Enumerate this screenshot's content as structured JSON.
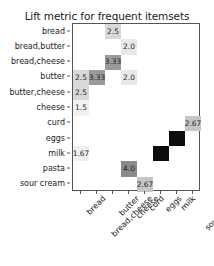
{
  "chart_data": {
    "type": "heatmap",
    "title": "Lift metric for frequent itemsets",
    "xlabel": "",
    "ylabel": "",
    "grid": false,
    "legend": "none",
    "colormap": "grays-reversed",
    "value_range": [
      1.5,
      9.0
    ],
    "columns": [
      "bread",
      "bread,cheese",
      "butter",
      "cheese",
      "curd",
      "eggs",
      "milk",
      "sour cream"
    ],
    "rows": [
      "bread",
      "bread,butter",
      "bread,cheese",
      "butter",
      "butter,cheese",
      "cheese",
      "curd",
      "eggs",
      "milk",
      "pasta",
      "sour cream"
    ],
    "cells": [
      {
        "row": "bread",
        "col": "butter",
        "value": "2.5",
        "shade": "#d9d9d9",
        "text_color": "#262626"
      },
      {
        "row": "bread,butter",
        "col": "cheese",
        "value": "2.0",
        "shade": "#e8e8e8",
        "text_color": "#262626"
      },
      {
        "row": "bread,cheese",
        "col": "butter",
        "value": "3.33",
        "shade": "#9a9a9a",
        "text_color": "#262626"
      },
      {
        "row": "butter",
        "col": "bread",
        "value": "2.5",
        "shade": "#d9d9d9",
        "text_color": "#262626"
      },
      {
        "row": "butter",
        "col": "bread,cheese",
        "value": "3.33",
        "shade": "#9a9a9a",
        "text_color": "#262626"
      },
      {
        "row": "butter",
        "col": "cheese",
        "value": "2.0",
        "shade": "#e8e8e8",
        "text_color": "#262626"
      },
      {
        "row": "butter,cheese",
        "col": "bread",
        "value": "2.5",
        "shade": "#d9d9d9",
        "text_color": "#262626"
      },
      {
        "row": "cheese",
        "col": "bread",
        "value": "1.5",
        "shade": "#f2f2f2",
        "text_color": "#262626"
      },
      {
        "row": "curd",
        "col": "sour cream",
        "value": "2.67",
        "shade": "#c6c6c6",
        "text_color": "#262626"
      },
      {
        "row": "eggs",
        "col": "milk",
        "value": "9.0",
        "shade": "#0d0d0d",
        "text_color": "#1a1a1a"
      },
      {
        "row": "milk",
        "col": "eggs",
        "value": "9.0",
        "shade": "#0d0d0d",
        "text_color": "#1a1a1a"
      },
      {
        "row": "milk",
        "col": "bread",
        "value": "1.67",
        "shade": "#efefef",
        "text_color": "#262626"
      },
      {
        "row": "pasta",
        "col": "cheese",
        "value": "4.0",
        "shade": "#8a8a8a",
        "text_color": "#262626"
      },
      {
        "row": "sour cream",
        "col": "curd",
        "value": "2.67",
        "shade": "#c6c6c6",
        "text_color": "#262626"
      }
    ]
  }
}
